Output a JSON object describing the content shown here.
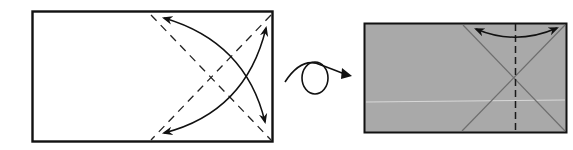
{
  "diagram": {
    "type": "origami-instruction",
    "steps": [
      {
        "id": "step-1",
        "paper_color": "#ffffff",
        "border_color": "#111111",
        "fold_lines": [
          {
            "kind": "valley-dashed",
            "from": [
              150,
              14
            ],
            "to": [
              271,
              140
            ]
          },
          {
            "kind": "valley-dashed",
            "from": [
              271,
              14
            ],
            "to": [
              150,
              140
            ]
          }
        ],
        "fold_arrows": [
          {
            "kind": "curved-double-arrow",
            "from": [
              163,
              17
            ],
            "to": [
              265,
              124
            ]
          },
          {
            "kind": "curved-double-arrow",
            "from": [
              265,
              26
            ],
            "to": [
              163,
              133
            ]
          }
        ]
      },
      {
        "id": "turn-over",
        "symbol": "turn-over-loop-arrow"
      },
      {
        "id": "step-2",
        "paper_color": "#a9a9a9",
        "border_color": "#111111",
        "crease_lines": [
          {
            "kind": "crease",
            "from": [
              463,
              25
            ],
            "to": [
              565,
              131
            ]
          },
          {
            "kind": "crease",
            "from": [
              565,
              25
            ],
            "to": [
              462,
              131
            ]
          }
        ],
        "fold_lines": [
          {
            "kind": "valley-dashed-vertical",
            "x": 515
          }
        ],
        "fold_arrows": [
          {
            "kind": "curved-double-arrow",
            "from": [
              475,
              28
            ],
            "to": [
              558,
              28
            ]
          }
        ]
      }
    ]
  },
  "colors": {
    "ink": "#111111",
    "paper_front": "#ffffff",
    "paper_back": "#a9a9a9",
    "crease": "#6e6e6e",
    "highlight": "#d8d8d8"
  }
}
